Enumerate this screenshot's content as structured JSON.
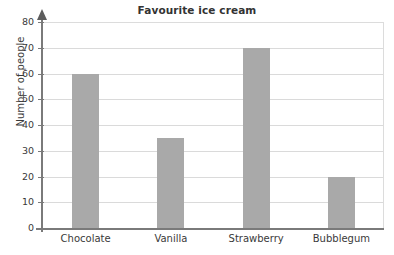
{
  "chart_data": {
    "type": "bar",
    "title": "Favourite ice cream",
    "xlabel": "",
    "ylabel": "Number of people",
    "categories": [
      "Chocolate",
      "Vanilla",
      "Strawberry",
      "Bubblegum"
    ],
    "values": [
      60,
      35,
      70,
      20
    ],
    "ylim": [
      0,
      80
    ],
    "ytick_step": 10,
    "yticks": [
      0,
      10,
      20,
      30,
      40,
      50,
      60,
      70,
      80
    ],
    "ytick_labels": [
      "0",
      "10",
      "20",
      "30",
      "40",
      "50",
      "60",
      "70",
      "80"
    ],
    "grid": true,
    "grid_axis": "y",
    "legend": null,
    "legend_position": "none",
    "series": [
      {
        "name": "Number of people",
        "values": [
          60,
          35,
          70,
          20
        ]
      }
    ],
    "colors": {
      "bar_fill": "#a9a9a9",
      "gridline": "#dadada",
      "axis": "#7a7a7a",
      "text": "#3a3a3a",
      "title": "#333333",
      "background": "#ffffff",
      "plot_border": "#dcdcdc"
    }
  }
}
